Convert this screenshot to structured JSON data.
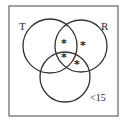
{
  "diagram": {
    "type": "venn",
    "frame": {
      "x": 9,
      "y": 6,
      "width": 109,
      "height": 110,
      "stroke": "#444444"
    },
    "sets": [
      {
        "id": "T",
        "label": "T",
        "cx": 50,
        "cy": 46,
        "r": 27,
        "label_x": 19,
        "label_y": 30
      },
      {
        "id": "R",
        "label": "R",
        "cx": 81,
        "cy": 46,
        "r": 26,
        "label_x": 101,
        "label_y": 30
      },
      {
        "id": "B",
        "label": "<15",
        "cx": 65,
        "cy": 77,
        "r": 25,
        "label_x": 90,
        "label_y": 101
      }
    ],
    "markers": [
      {
        "symbol": "*",
        "region": "T∩R only",
        "x": 64,
        "y": 47
      },
      {
        "symbol": "*",
        "region": "R only",
        "x": 83,
        "y": 49
      },
      {
        "symbol": "*",
        "region": "T∩R∩<15",
        "x": 64,
        "y": 61
      },
      {
        "symbol": "*",
        "region": "R∩<15 only",
        "x": 77,
        "y": 68
      }
    ],
    "stroke_color": "#333333"
  }
}
